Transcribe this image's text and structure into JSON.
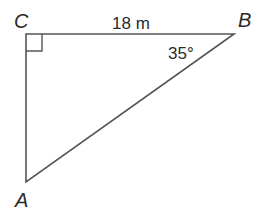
{
  "diagram": {
    "type": "right-triangle",
    "vertices": {
      "C": {
        "label": "C",
        "right_angle": true
      },
      "B": {
        "label": "B"
      },
      "A": {
        "label": "A"
      }
    },
    "side_CB": {
      "label": "18 m"
    },
    "angle_B": {
      "label": "35°"
    },
    "colors": {
      "stroke": "#555555",
      "text": "#2b2b2b",
      "background": "#ffffff"
    }
  }
}
